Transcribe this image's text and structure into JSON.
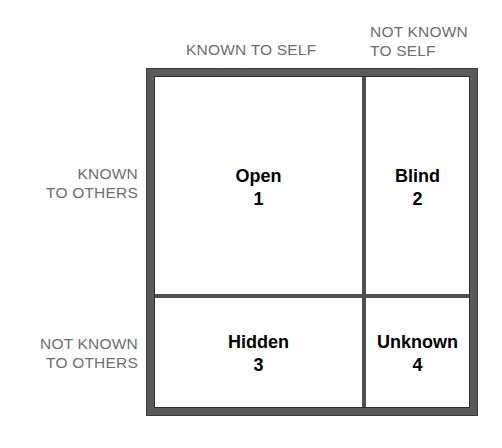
{
  "diagram": {
    "name": "Johari Window",
    "frame_color": "#5a5a5a",
    "mullion_color": "#4f4f4f",
    "pane_color": "#ffffff",
    "label_color": "#6e6e6e",
    "text_color": "#000000"
  },
  "axis_labels": {
    "top_left": "KNOWN TO SELF",
    "top_right": "NOT KNOWN\nTO SELF",
    "left_top": "KNOWN\nTO OTHERS",
    "left_bottom": "NOT KNOWN\nTO OTHERS"
  },
  "panes": [
    {
      "id": "open",
      "title": "Open",
      "number": "1"
    },
    {
      "id": "blind",
      "title": "Blind",
      "number": "2"
    },
    {
      "id": "hidden",
      "title": "Hidden",
      "number": "3"
    },
    {
      "id": "unknown",
      "title": "Unknown",
      "number": "4"
    }
  ],
  "chart_data": {
    "type": "table",
    "xlabel": "Known to self / Not known to self",
    "ylabel": "Known to others / Not known to others",
    "columns": [
      "KNOWN TO SELF",
      "NOT KNOWN TO SELF"
    ],
    "rows": [
      "KNOWN TO OTHERS",
      "NOT KNOWN TO OTHERS"
    ],
    "cells": [
      [
        {
          "label": "Open",
          "number": 1
        },
        {
          "label": "Blind",
          "number": 2
        }
      ],
      [
        {
          "label": "Hidden",
          "number": 3
        },
        {
          "label": "Unknown",
          "number": 4
        }
      ]
    ],
    "column_widths_pct": [
      66.6,
      33.4
    ],
    "row_heights_pct": [
      66.4,
      33.6
    ],
    "grid": true,
    "legend": "none"
  }
}
